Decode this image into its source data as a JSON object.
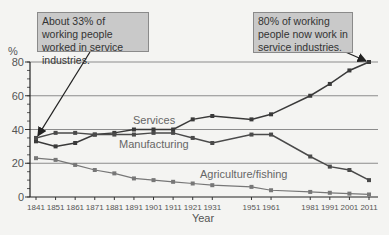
{
  "chart_data": {
    "type": "line",
    "title": "",
    "xlabel": "Year",
    "ylabel": "%",
    "ylim": [
      0,
      80
    ],
    "yticks": [
      0,
      20,
      40,
      60,
      80
    ],
    "grid": "horizontal",
    "x": [
      1841,
      1851,
      1861,
      1871,
      1881,
      1891,
      1901,
      1911,
      1921,
      1931,
      1951,
      1961,
      1981,
      1991,
      2001,
      2011
    ],
    "series": [
      {
        "name": "Services",
        "values": [
          33,
          30,
          32,
          37,
          38,
          40,
          40,
          40,
          46,
          48,
          46,
          49,
          60,
          67,
          75,
          80
        ]
      },
      {
        "name": "Manufacturing",
        "values": [
          35,
          38,
          38,
          37,
          37,
          37,
          38,
          38,
          35,
          32,
          37,
          37,
          24,
          18,
          16,
          10
        ]
      },
      {
        "name": "Agriculture/fishing",
        "values": [
          23,
          22,
          19,
          16,
          14,
          11,
          10,
          9,
          8,
          7,
          6,
          4,
          3,
          2.5,
          2,
          1.5
        ]
      }
    ],
    "annotations": [
      {
        "text": "About 33% of working people worked in service industries.",
        "points_to": {
          "x": 1841,
          "y": 33
        }
      },
      {
        "text": "80% of working people now work in service industries.",
        "points_to": {
          "x": 2011,
          "y": 80
        }
      }
    ]
  },
  "labels": {
    "y_unit": "%",
    "x_title": "Year",
    "services": "Services",
    "manufacturing": "Manufacturing",
    "agriculture": "Agriculture/fishing",
    "callout_left": "About 33% of working people worked in service industries.",
    "callout_right": "80% of working people now work in service industries."
  }
}
